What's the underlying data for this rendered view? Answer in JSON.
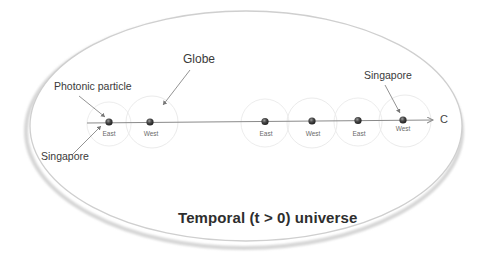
{
  "diagram": {
    "title": "Temporal (t > 0) universe",
    "axis_end_label": "C",
    "callouts": {
      "globe": "Globe",
      "photonic_particle": "Photonic particle",
      "singapore_left": "Singapore",
      "singapore_right": "Singapore"
    },
    "nodes": [
      {
        "label": "East",
        "x": 109
      },
      {
        "label": "West",
        "x": 150
      },
      {
        "label": "East",
        "x": 265
      },
      {
        "label": "West",
        "x": 312
      },
      {
        "label": "East",
        "x": 358
      },
      {
        "label": "West",
        "x": 403
      }
    ],
    "colors": {
      "background": "#ffffff",
      "ellipse_border": "#c8c8c8",
      "axis_line": "#8a8a8a",
      "sphere": "#3a3a3a",
      "globe_circle": "#ececec",
      "text": "#333333"
    }
  }
}
